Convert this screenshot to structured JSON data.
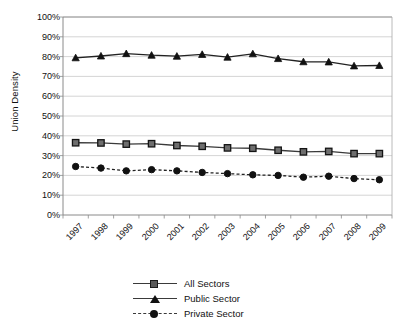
{
  "chart_data": {
    "type": "line",
    "title": "",
    "xlabel": "",
    "ylabel": "Union Density",
    "ylim": [
      0,
      100
    ],
    "ytick_labels": [
      "0%",
      "10%",
      "20%",
      "30%",
      "40%",
      "50%",
      "60%",
      "70%",
      "80%",
      "90%",
      "100%"
    ],
    "ytick_values": [
      0,
      10,
      20,
      30,
      40,
      50,
      60,
      70,
      80,
      90,
      100
    ],
    "grid": "horizontal",
    "legend_position": "bottom",
    "categories": [
      "1997",
      "1998",
      "1999",
      "2000",
      "2001",
      "2002",
      "2003",
      "2004",
      "2005",
      "2006",
      "2007",
      "2008",
      "2009"
    ],
    "series": [
      {
        "name": "All Sectors",
        "marker": "square",
        "line_style": "solid",
        "color": "#3a3a3a",
        "values": [
          36.5,
          36.4,
          35.8,
          36.0,
          35.1,
          34.7,
          33.9,
          33.7,
          32.7,
          31.9,
          32.1,
          31.0,
          31.0
        ]
      },
      {
        "name": "Public Sector",
        "marker": "triangle",
        "line_style": "solid",
        "color": "#222222",
        "values": [
          79.4,
          80.3,
          81.5,
          80.7,
          80.2,
          81.1,
          79.7,
          81.4,
          79.0,
          77.4,
          77.3,
          75.3,
          75.5
        ]
      },
      {
        "name": "Private Sector",
        "marker": "circle",
        "line_style": "dashed",
        "color": "#222222",
        "values": [
          24.5,
          23.7,
          22.3,
          22.9,
          22.3,
          21.5,
          20.9,
          20.3,
          20.0,
          19.1,
          19.6,
          18.4,
          17.8
        ]
      }
    ]
  },
  "legend": {
    "items": [
      {
        "label": "All Sectors"
      },
      {
        "label": "Public Sector"
      },
      {
        "label": "Private Sector"
      }
    ]
  }
}
